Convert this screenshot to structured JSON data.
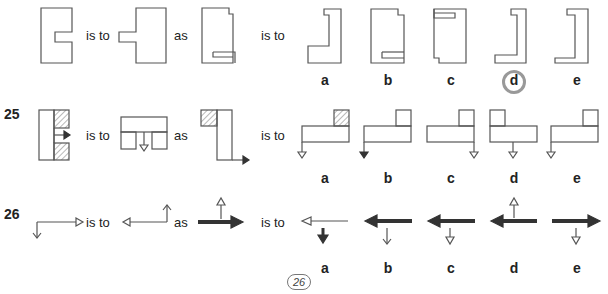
{
  "questions": [
    {
      "number": "",
      "connectors": [
        "is to",
        "as",
        "is to"
      ],
      "options": [
        "a",
        "b",
        "c",
        "d",
        "e"
      ],
      "circled_answer": "d",
      "description": "Notched rectangle transformations (mirror of notch)"
    },
    {
      "number": "25",
      "connectors": [
        "is to",
        "as",
        "is to"
      ],
      "options": [
        "a",
        "b",
        "c",
        "d",
        "e"
      ],
      "description": "Block shapes with hatched squares and arrows, rotated"
    },
    {
      "number": "26",
      "connectors": [
        "is to",
        "as",
        "is to"
      ],
      "options": [
        "a",
        "b",
        "c",
        "d",
        "e"
      ],
      "description": "Arrow combinations with thin and bold arrows"
    }
  ],
  "page_number": "26",
  "colors": {
    "line": "#555555",
    "text": "#222222",
    "answer_circle": "#999999",
    "hatch": "#888888"
  }
}
